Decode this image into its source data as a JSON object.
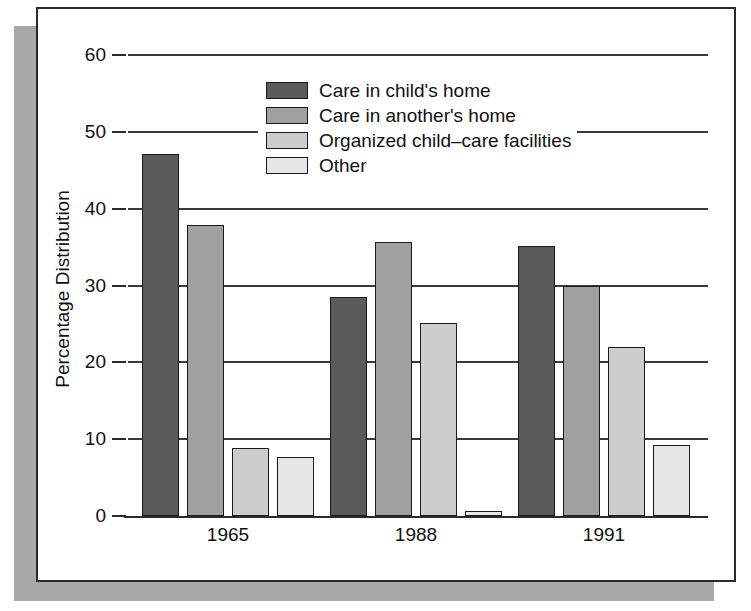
{
  "chart_data": {
    "type": "bar",
    "title": "",
    "xlabel": "",
    "ylabel": "Percentage Distribution",
    "categories": [
      "1965",
      "1988",
      "1991"
    ],
    "ylim": [
      0,
      60
    ],
    "yticks": [
      0,
      10,
      20,
      30,
      40,
      50,
      60
    ],
    "ytick_labels": [
      "0",
      "10",
      "20",
      "30",
      "40",
      "50",
      "60"
    ],
    "grid": true,
    "grid_axis": "y",
    "legend_position": "upper-center",
    "series": [
      {
        "name": "Care in child's home",
        "color": "#5a5a5a",
        "values": [
          47.1,
          28.5,
          35.2
        ]
      },
      {
        "name": "Care in another's home",
        "color": "#a0a0a0",
        "values": [
          37.9,
          35.7,
          30.0
        ]
      },
      {
        "name": "Organized child–care facilities",
        "color": "#cdcdcd",
        "values": [
          8.8,
          25.1,
          22.0
        ]
      },
      {
        "name": "Other",
        "color": "#e6e6e6",
        "values": [
          7.7,
          0.7,
          9.2
        ]
      }
    ]
  },
  "frame": {
    "border_color": "#2b2b2b",
    "shadow_color": "#a8a8a8",
    "background": "#ffffff"
  }
}
